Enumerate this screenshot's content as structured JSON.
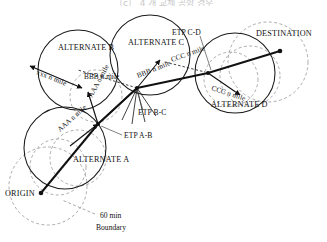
{
  "caption": {
    "text": "（c） 4 개 교체 공항 경우"
  },
  "figure": {
    "colors": {
      "line": "#111111",
      "circle_solid": "#1a1a1a",
      "circle_dashed": "#8a8a8a",
      "text": "#111111"
    }
  },
  "nodes": [
    {
      "id": "origin",
      "label": "ORIGIN",
      "x": 41,
      "y": 193
    },
    {
      "id": "destination",
      "label": "DESTINATION",
      "x": 280,
      "y": 51
    }
  ],
  "alternates": [
    {
      "id": "alt-a",
      "label": "ALTERNATE A",
      "cx": 65,
      "cy": 148,
      "r": 41
    },
    {
      "id": "alt-b",
      "label": "ALTERNATE B",
      "cx": 78,
      "cy": 70,
      "r": 40
    },
    {
      "id": "alt-c",
      "label": "ALTERNATE C",
      "cx": 150,
      "cy": 55,
      "r": 40
    },
    {
      "id": "alt-d",
      "label": "ALTERNATE D",
      "cx": 235,
      "cy": 73,
      "r": 40
    }
  ],
  "etp_points": [
    {
      "id": "etp-a-b",
      "label": "ETP A-B",
      "x": 98,
      "y": 124
    },
    {
      "id": "etp-b-c",
      "label": "ETP B-C",
      "x": 137,
      "y": 88
    },
    {
      "id": "etp-c-d",
      "label": "ETP C-D",
      "x": 208,
      "y": 73
    }
  ],
  "distance_labels": [
    {
      "id": "dist-xxx",
      "text": "xxx n mile",
      "x": 36,
      "y": 74,
      "rotate": -20
    },
    {
      "id": "dist-bbb-1",
      "text": "BBB n mile",
      "x": 84,
      "y": 79,
      "rotate": 0
    },
    {
      "id": "dist-bbb-2",
      "text": "BBB n mile",
      "x": 140,
      "y": 75,
      "rotate": -22
    },
    {
      "id": "dist-ccc-1",
      "text": "CCC n mile",
      "x": 176,
      "y": 64,
      "rotate": -20
    },
    {
      "id": "dist-ccc-2",
      "text": "CCC n mile",
      "x": 215,
      "y": 89,
      "rotate": -18
    },
    {
      "id": "dist-aaa-1",
      "text": "AAA n mile",
      "x": 92,
      "y": 96,
      "rotate": 62
    },
    {
      "id": "dist-aaa-2",
      "text": "AAA n mile",
      "x": 62,
      "y": 126,
      "rotate": 42
    }
  ],
  "legend": {
    "line1": "60 min",
    "line2": "Boundary",
    "x": 100,
    "y": 216
  }
}
